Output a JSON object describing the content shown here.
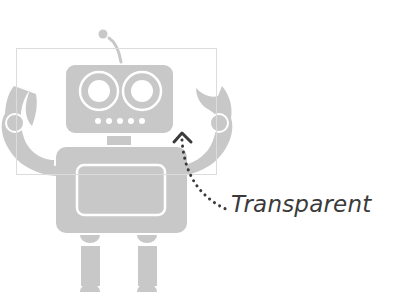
{
  "figure": {
    "annotation": {
      "label": "Transparent",
      "arrow_style": "dotted curved arrow"
    },
    "colors": {
      "robot_fill": "#c8c8c8",
      "robot_outline": "#ffffff",
      "selection_box": "#dcdcdc",
      "annotation": "#3a3a3a",
      "background": "#ffffff"
    },
    "parts": [
      "antenna",
      "head",
      "eyes",
      "mouth-dots",
      "neck",
      "body",
      "body-panel",
      "left-arm",
      "right-arm",
      "left-leg",
      "right-leg",
      "selection-box"
    ]
  }
}
